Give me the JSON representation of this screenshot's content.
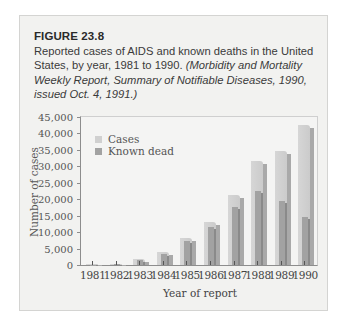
{
  "figure": {
    "label": "FIGURE 23.8",
    "caption_plain": "Reported cases of AIDS and known deaths in the United States, by year, 1981 to 1990.",
    "caption_source": "(Morbidity and Mortality Weekly Report, Summary of Notifiable Diseases, 1990, issued Oct. 4, 1991.)"
  },
  "legend": {
    "cases": "Cases",
    "dead": "Known dead"
  },
  "colors": {
    "cases": "#d0d0d0",
    "dead": "#a2a2a2",
    "panel": "#f2f2f0"
  },
  "axes": {
    "ylabel": "Number of cases",
    "xlabel": "Year of report",
    "yticks": [
      "0",
      "5,000",
      "10,000",
      "15,000",
      "20,000",
      "25,000",
      "30,000",
      "35,000",
      "40,000",
      "45,000"
    ]
  },
  "chart_data": {
    "type": "bar",
    "title": "Reported cases of AIDS and known deaths in the United States, by year, 1981 to 1990",
    "xlabel": "Year of report",
    "ylabel": "Number of cases",
    "ylim": [
      0,
      45000
    ],
    "grid": false,
    "legend_position": "upper left",
    "categories": [
      "1981",
      "1982",
      "1983",
      "1984",
      "1985",
      "1986",
      "1987",
      "1988",
      "1989",
      "1990"
    ],
    "series": [
      {
        "name": "Cases",
        "values": [
          200,
          400,
          1700,
          4000,
          8200,
          13000,
          21200,
          31700,
          34800,
          42700
        ]
      },
      {
        "name": "Known dead",
        "values": [
          100,
          200,
          1500,
          3500,
          7300,
          11500,
          17500,
          22500,
          19500,
          14500
        ]
      }
    ]
  }
}
